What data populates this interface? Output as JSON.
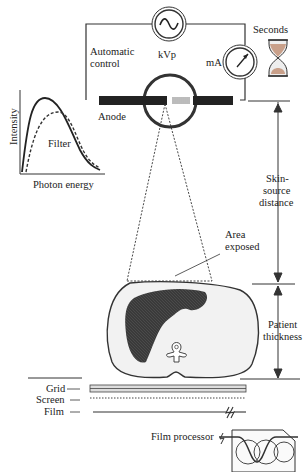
{
  "diagram": {
    "type": "x-ray-imaging-system",
    "colors": {
      "line": "#333333",
      "dark_fill": "#3a3a3a",
      "patient_fill": "#f2f2f2",
      "background": "#ffffff"
    },
    "circuit": {
      "kvp_label": "kVp",
      "automatic_control_label_line1": "Automatic",
      "automatic_control_label_line2": "control",
      "ma_label": "mA",
      "seconds_label": "Seconds"
    },
    "tube": {
      "anode_label": "Anode"
    },
    "spectrum_plot": {
      "y_axis_label": "Intensity",
      "x_axis_label": "Photon energy",
      "filter_label": "Filter"
    },
    "beam": {
      "area_exposed_line1": "Area",
      "area_exposed_line2": "exposed"
    },
    "dimensions": {
      "skin_source_line1": "Skin-",
      "skin_source_line2": "source",
      "skin_source_line3": "distance",
      "patient_thickness_line1": "Patient",
      "patient_thickness_line2": "thickness"
    },
    "detector": {
      "grid_label": "Grid",
      "screen_label": "Screen",
      "film_label": "Film",
      "film_processor_label": "Film processor"
    }
  }
}
